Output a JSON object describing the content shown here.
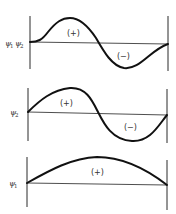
{
  "panels": [
    {
      "id": "psi1psi2",
      "label_main": "ψ",
      "label_sub1": "1",
      "label_main2": "ψ",
      "label_sub2": "2",
      "description": "Product of wavefunctions psi1 and psi2: positive lobe then negative lobe",
      "regions": [
        {
          "sign": "(+)"
        },
        {
          "sign": "(−)"
        }
      ]
    },
    {
      "id": "psi2",
      "label_main": "ψ",
      "label_sub": "2",
      "description": "Second wavefunction: one full sine period, positive then negative",
      "regions": [
        {
          "sign": "(+)"
        },
        {
          "sign": "(−)"
        }
      ]
    },
    {
      "id": "psi1",
      "label_main": "ψ",
      "label_sub": "1",
      "description": "First wavefunction: half sine period, entirely positive",
      "regions": [
        {
          "sign": "(+)"
        }
      ]
    }
  ],
  "colors": {
    "curve": "#111111",
    "axis": "#2a2a2a",
    "text": "#333333",
    "background": "#ffffff"
  }
}
